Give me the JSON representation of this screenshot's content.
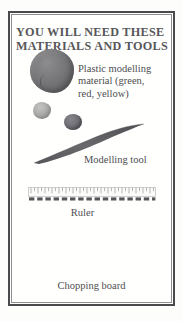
{
  "panel": {
    "heading": "YOU WILL NEED THESE\nMATERIALS AND TOOLS",
    "items": [
      {
        "id": "plastic-modelling-material",
        "label": "Plastic modelling\nmaterial (green,\nred, yellow)",
        "illustration": "clay-blobs"
      },
      {
        "id": "modelling-tool",
        "label": "Modelling tool",
        "illustration": "blade-tool"
      },
      {
        "id": "ruler",
        "label": "Ruler",
        "illustration": "ruler-strip"
      },
      {
        "id": "chopping-board",
        "label": "Chopping board",
        "illustration": "none"
      }
    ],
    "labels": {
      "plastic_material": "Plastic modelling\nmaterial (green,\nred, yellow)",
      "modelling_tool": "Modelling tool",
      "ruler": "Ruler",
      "chopping_board": "Chopping board"
    }
  },
  "colors": {
    "frame_outer": "#4a4a4c",
    "frame_inner": "#8e8e90",
    "heading_text": "#57575a",
    "label_text": "#4e4e51",
    "clay_green": "#6f6f72",
    "clay_yellow": "#a9a9a8",
    "clay_red": "#6e6e74",
    "tool_body": "#5f5f63",
    "ruler_body": "#8b8b8d",
    "page_background": "#fdfdfc",
    "panel_background": "#fffffe"
  },
  "icons": {
    "clay_green": "clay-blob-icon",
    "clay_yellow": "clay-pebble-icon",
    "clay_red": "clay-ball-icon",
    "tool": "modelling-tool-icon",
    "ruler": "ruler-icon"
  }
}
